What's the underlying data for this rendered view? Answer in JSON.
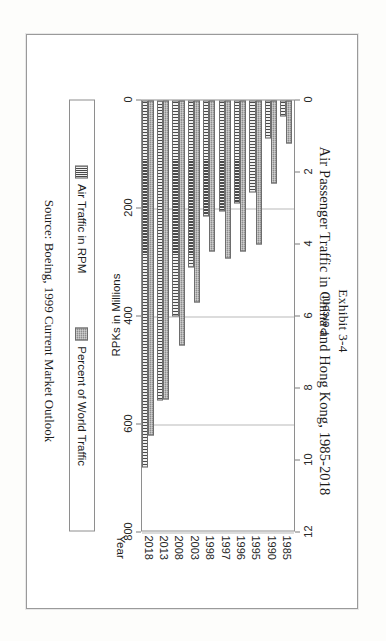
{
  "figure": {
    "exhibit_label": "Exhibit 3-4",
    "title": "Air Passenger Traffic in China and Hong Kong, 1985-2018",
    "source": "Source:  Boeing, 1999 Current Market Outlook"
  },
  "legend": {
    "items": [
      {
        "label": "Air Traffic in RPM",
        "pattern": "vertical-stripes",
        "color": "#4a4a4a"
      },
      {
        "label": "Percent of World Traffic",
        "pattern": "solid-gray",
        "color": "#8e8e8e"
      }
    ]
  },
  "chart_data": {
    "type": "bar",
    "title": "Air Passenger Traffic in China and Hong Kong, 1985-2018",
    "subtitle": "Exhibit 3-4",
    "orientation": "vertical-grouped",
    "categories": [
      "1985",
      "1990",
      "1995",
      "1996",
      "1997",
      "1998",
      "2003",
      "2008",
      "2013",
      "2018"
    ],
    "xlabel": "Year",
    "series": [
      {
        "name": "Air Traffic in RPM",
        "axis": "left",
        "ylabel": "RPKs in Millions",
        "ylim": [
          0,
          800
        ],
        "yticks": [
          "0",
          "200",
          "400",
          "600",
          "800"
        ],
        "values": [
          30,
          70,
          170,
          190,
          205,
          215,
          310,
          400,
          555,
          680
        ]
      },
      {
        "name": "Percent of World Traffic",
        "axis": "right",
        "ylabel": "Percent",
        "ylim": [
          0,
          12
        ],
        "yticks": [
          "0",
          "2",
          "4",
          "6",
          "8",
          "10",
          "12"
        ],
        "values": [
          1.2,
          2.3,
          4.0,
          4.2,
          4.4,
          4.2,
          5.6,
          6.8,
          8.3,
          9.3
        ]
      }
    ],
    "grid": true,
    "legend_position": "bottom"
  },
  "axes": {
    "left": {
      "title": "RPKs in Millions",
      "ticks": [
        "0",
        "200",
        "400",
        "600",
        "800"
      ]
    },
    "right": {
      "title": "Percent",
      "ticks": [
        "0",
        "2",
        "4",
        "6",
        "8",
        "10",
        "12"
      ]
    },
    "category": {
      "title": "Year"
    }
  },
  "page": {
    "rotation_degrees": 90,
    "background": "#ffffff",
    "border_color": "#9a9a9a"
  }
}
